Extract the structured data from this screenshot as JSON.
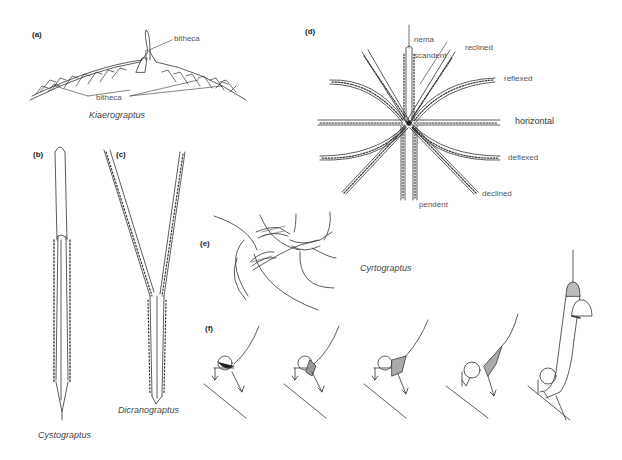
{
  "figure": {
    "panels": [
      {
        "id": "a",
        "label": "(a)",
        "genus": "Kiaerograptus",
        "annotations": [
          "bitheca",
          "bitheca"
        ]
      },
      {
        "id": "b",
        "label": "(b)",
        "genus": "Cystograptus"
      },
      {
        "id": "c",
        "label": "(c)",
        "genus": "Dicranograptus"
      },
      {
        "id": "d",
        "label": "(d)",
        "annotations": [
          "nema",
          "scandent",
          "reclined",
          "reflexed",
          "horizontal",
          "deflexed",
          "declined",
          "pendent"
        ]
      },
      {
        "id": "e",
        "label": "(e)",
        "genus": "Cyrtograptus"
      },
      {
        "id": "f",
        "label": "(f)"
      }
    ]
  },
  "colors": {
    "line": "#333333",
    "label": "#555555",
    "background": "#ffffff"
  }
}
